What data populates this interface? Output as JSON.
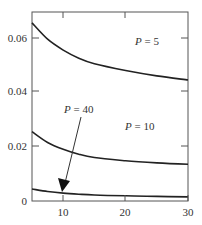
{
  "chart_data": {
    "type": "line",
    "title": "",
    "xlabel": "",
    "ylabel": "",
    "xlim": [
      5,
      30
    ],
    "ylim": [
      0,
      0.0695
    ],
    "grid": false,
    "x_ticks": [
      10,
      20,
      30
    ],
    "x_tick_labels": [
      "10",
      "20",
      "30"
    ],
    "y_ticks": [
      0,
      0.02,
      0.04,
      0.06
    ],
    "y_tick_labels": [
      "0",
      "0.02",
      "0.04",
      "0.06"
    ],
    "series": [
      {
        "name": "P = 5",
        "x": [
          5,
          7.5,
          10,
          12.5,
          15,
          20,
          25,
          30
        ],
        "values": [
          0.0655,
          0.0595,
          0.0555,
          0.0525,
          0.0505,
          0.048,
          0.046,
          0.0445
        ]
      },
      {
        "name": "P = 10",
        "x": [
          5,
          7.5,
          10,
          12.5,
          15,
          20,
          25,
          30
        ],
        "values": [
          0.0255,
          0.0215,
          0.019,
          0.0172,
          0.016,
          0.0148,
          0.014,
          0.0135
        ]
      },
      {
        "name": "P = 40",
        "x": [
          5,
          7.5,
          10,
          12.5,
          15,
          20,
          25,
          30
        ],
        "values": [
          0.0044,
          0.0035,
          0.0029,
          0.0025,
          0.0022,
          0.0019,
          0.0017,
          0.0015
        ]
      }
    ],
    "annotations": [
      {
        "text_var": "P",
        "text_rest": " = 5",
        "x_px": 135,
        "y_px": 45
      },
      {
        "text_var": "P",
        "text_rest": " = 10",
        "x_px": 125,
        "y_px": 130
      },
      {
        "text_var": "P",
        "text_rest": " = 40",
        "x_px": 64,
        "y_px": 113,
        "arrow_to_x": 10,
        "arrow_to_y": 0.003
      }
    ]
  },
  "labels": {
    "x": [
      "10",
      "20",
      "30"
    ],
    "y": [
      "0",
      "0.02",
      "0.04",
      "0.06"
    ],
    "ann": [
      {
        "var": "P",
        "rest": " = 5"
      },
      {
        "var": "P",
        "rest": " = 10"
      },
      {
        "var": "P",
        "rest": " = 40"
      }
    ]
  }
}
